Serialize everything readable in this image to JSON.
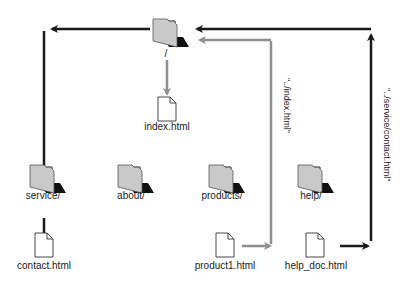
{
  "diagram": {
    "type": "site-structure",
    "colors": {
      "black_arrow": "#1a1a1a",
      "gray_arrow": "#8f8f8f",
      "folder_fill": "#c9c9c9",
      "folder_shadow": "#111111",
      "file_fill": "#ffffff"
    },
    "nodes": {
      "root": {
        "label": "/",
        "kind": "folder"
      },
      "index": {
        "label": "index.html",
        "kind": "file"
      },
      "service": {
        "label": "service/",
        "kind": "folder"
      },
      "about": {
        "label": "about/",
        "kind": "folder"
      },
      "products": {
        "label": "products/",
        "kind": "folder"
      },
      "help": {
        "label": "help/",
        "kind": "folder"
      },
      "contact": {
        "label": "contact.html",
        "kind": "file"
      },
      "product1": {
        "label": "product1.html",
        "kind": "file"
      },
      "help_doc": {
        "label": "help_doc.html",
        "kind": "file"
      }
    },
    "edges": [
      {
        "from": "root",
        "to": "index",
        "style": "gray"
      },
      {
        "from": "root",
        "to": "service",
        "style": "black"
      },
      {
        "from": "service",
        "to": "contact",
        "style": "black"
      },
      {
        "from": "product1",
        "to": "root",
        "style": "gray",
        "label": "\"../index.html\""
      },
      {
        "from": "help_doc",
        "to": "root",
        "style": "black",
        "label": "\"../service/contact.html\""
      }
    ],
    "edge_labels": {
      "product1_to_root": "\"../index.html\"",
      "help_doc_to_root": "\"../service/contact.html\""
    }
  }
}
